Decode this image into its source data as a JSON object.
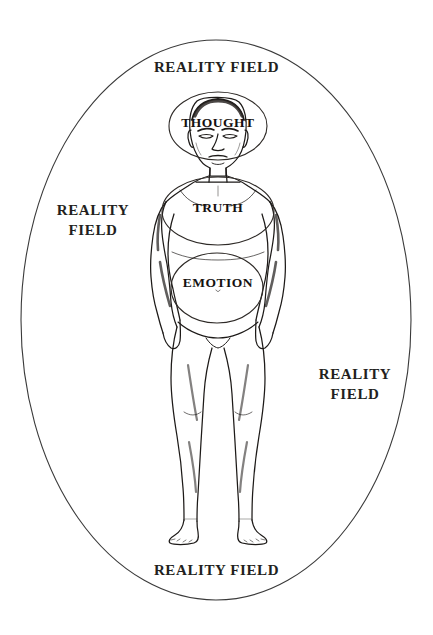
{
  "canvas": {
    "width": 433,
    "height": 635,
    "background_color": "#ffffff",
    "ink_color": "#231f20"
  },
  "outer_field": {
    "shape": "ellipse",
    "center_x": 216,
    "center_y": 320,
    "radius_x": 195,
    "radius_y": 280,
    "stroke_color": "#3a3a3a"
  },
  "field_labels": {
    "top": "REALITY FIELD",
    "left": "REALITY\nFIELD",
    "right": "REALITY\nFIELD",
    "bottom": "REALITY FIELD"
  },
  "zones": [
    {
      "id": "thought",
      "label": "THOUGHT",
      "center_x": 218,
      "center_y": 126,
      "radius_x": 49,
      "radius_y": 34,
      "body_part": "head"
    },
    {
      "id": "truth",
      "label": "TRUTH",
      "center_x": 218,
      "center_y": 211,
      "radius_x": 56,
      "radius_y": 34,
      "body_part": "chest"
    },
    {
      "id": "emotion",
      "label": "EMOTION",
      "center_x": 217,
      "center_y": 288,
      "radius_x": 46,
      "radius_y": 35,
      "body_part": "abdomen"
    }
  ],
  "figure": {
    "icon_name": "human-figure-front-view"
  }
}
